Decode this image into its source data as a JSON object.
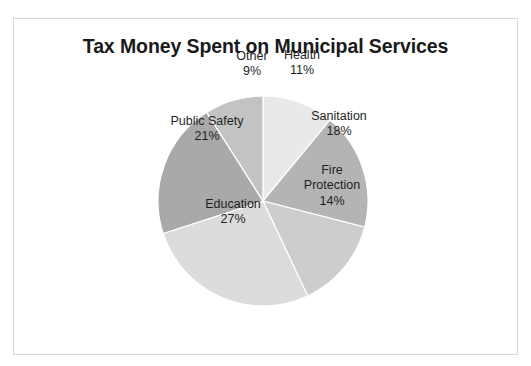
{
  "slide": {
    "title": "Tax Money Spent on Municipal Services",
    "background_color": "#ffffff",
    "frame_border_color": "#d8d8d8"
  },
  "chart_data": {
    "type": "pie",
    "title": "Tax Money Spent on Municipal Services",
    "xlabel": "",
    "ylabel": "",
    "legend": "none",
    "labels_inside_slices": true,
    "start_angle_deg": 0,
    "direction": "clockwise",
    "categories": [
      "Health",
      "Sanitation",
      "Fire Protection",
      "Education",
      "Public Safety",
      "Other"
    ],
    "values": [
      11,
      18,
      14,
      27,
      21,
      9
    ],
    "value_unit": "%",
    "total": 100,
    "colors": [
      "#e9e9e9",
      "#b4b4b4",
      "#cdcdcd",
      "#dcdcdc",
      "#a9a9a9",
      "#c3c3c3"
    ],
    "slices": [
      {
        "name": "Health",
        "name_line2": "",
        "value": 11,
        "value_label": "11%",
        "color": "#e9e9e9",
        "label_x": 288,
        "label_y": 44
      },
      {
        "name": "Sanitation",
        "name_line2": "",
        "value": 18,
        "value_label": "18%",
        "color": "#b4b4b4",
        "label_x": 325,
        "label_y": 105
      },
      {
        "name": "Fire",
        "name_line2": "Protection",
        "value": 14,
        "value_label": "14%",
        "color": "#cdcdcd",
        "label_x": 318,
        "label_y": 167
      },
      {
        "name": "Education",
        "name_line2": "",
        "value": 27,
        "value_label": "27%",
        "color": "#dcdcdc",
        "label_x": 219,
        "label_y": 193
      },
      {
        "name": "Public Safety",
        "name_line2": "",
        "value": 21,
        "value_label": "21%",
        "color": "#a9a9a9",
        "label_x": 193,
        "label_y": 110
      },
      {
        "name": "Other",
        "name_line2": "",
        "value": 9,
        "value_label": "9%",
        "color": "#c3c3c3",
        "label_x": 238,
        "label_y": 45
      }
    ]
  }
}
